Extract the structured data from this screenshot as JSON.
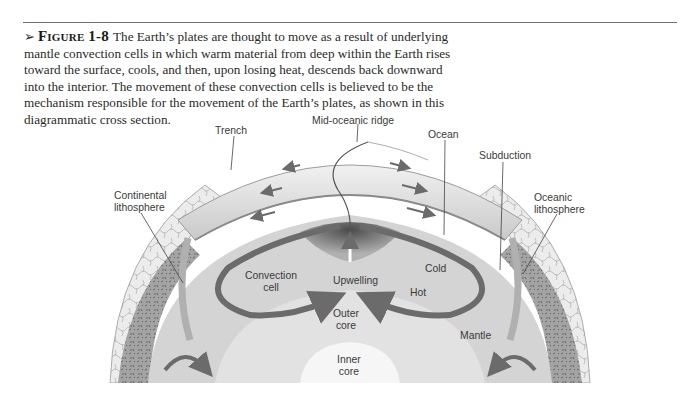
{
  "caption": {
    "figure_label": "Figure 1-8",
    "text": "The Earth’s plates are thought to move as a result of underlying mantle convection cells in which warm material from deep within the Earth rises toward the surface, cools, and then, upon losing heat, descends back downward into the interior. The movement of these convection cells is believed to be the mechanism responsible for the movement of the Earth’s plates, as shown in this diagrammatic cross section."
  },
  "diagram": {
    "labels": {
      "trench": "Trench",
      "mid_oceanic_ridge": "Mid-oceanic ridge",
      "ocean": "Ocean",
      "subduction": "Subduction",
      "continental_lithosphere": "Continental\nlithosphere",
      "oceanic_lithosphere": "Oceanic\nlithosphere",
      "convection_cell": "Convection\ncell",
      "upwelling": "Upwelling",
      "cold": "Cold",
      "hot": "Hot",
      "outer_core": "Outer\ncore",
      "mantle": "Mantle",
      "inner_core": "Inner\ncore"
    },
    "colors": {
      "arrow": "#6b6b6b",
      "crust_dark": "#8a8a8a",
      "mantle": "#d4d4d4",
      "outer_core": "#e2e2e2",
      "inner_core": "#f6f6f6"
    }
  }
}
